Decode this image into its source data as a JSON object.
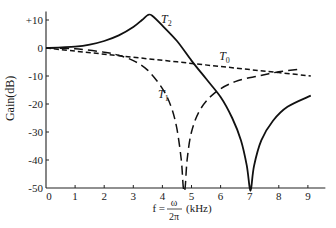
{
  "chart_data": {
    "type": "line",
    "title": "",
    "xlabel": "f = ω/2π (kHz)",
    "xlabel_parts": {
      "prefix": "f =",
      "num": "ω",
      "den": "2π",
      "suffix": "(kHz)"
    },
    "ylabel": "Gain(dB)",
    "xlim": [
      0,
      9.6
    ],
    "ylim": [
      -50,
      13
    ],
    "grid": false,
    "legend": "inline labels",
    "x_ticks": [
      0,
      1,
      2,
      3,
      4,
      5,
      6,
      7,
      8,
      9
    ],
    "x_tick_labels": [
      "0",
      "1",
      "2",
      "3",
      "4",
      "5",
      "6",
      "7",
      "8",
      "9"
    ],
    "y_ticks": [
      10,
      0,
      -10,
      -20,
      -30,
      -40,
      -50
    ],
    "y_tick_labels": [
      "+10",
      "0",
      "-10",
      "-20",
      "-30",
      "-40",
      "-50"
    ],
    "series": [
      {
        "name": "T0",
        "label": "T",
        "subscript": "0",
        "style": "short-dash",
        "points": [
          [
            0,
            0
          ],
          [
            1,
            -1.1
          ],
          [
            2,
            -2.2
          ],
          [
            3,
            -3.3
          ],
          [
            4,
            -4.4
          ],
          [
            5,
            -5.5
          ],
          [
            6,
            -6.6
          ],
          [
            7,
            -7.7
          ],
          [
            8,
            -8.8
          ],
          [
            9.1,
            -10
          ]
        ]
      },
      {
        "name": "T1",
        "label": "T",
        "subscript": "1",
        "style": "long-dash",
        "points": [
          [
            0,
            0
          ],
          [
            1,
            -0.3
          ],
          [
            2,
            -1.5
          ],
          [
            2.5,
            -2.6
          ],
          [
            3,
            -4.5
          ],
          [
            3.5,
            -8
          ],
          [
            4,
            -14.5
          ],
          [
            4.3,
            -21
          ],
          [
            4.5,
            -29
          ],
          [
            4.65,
            -40
          ],
          [
            4.72,
            -50
          ],
          [
            4.78,
            -50
          ],
          [
            4.85,
            -40
          ],
          [
            5,
            -30
          ],
          [
            5.3,
            -22
          ],
          [
            5.8,
            -16
          ],
          [
            6.5,
            -12
          ],
          [
            7.3,
            -10
          ],
          [
            8,
            -8.5
          ],
          [
            8.8,
            -7.5
          ]
        ]
      },
      {
        "name": "T2",
        "label": "T",
        "subscript": "2",
        "style": "solid",
        "points": [
          [
            0,
            0
          ],
          [
            1,
            0.5
          ],
          [
            1.5,
            1.2
          ],
          [
            2,
            2.5
          ],
          [
            2.5,
            4.5
          ],
          [
            3,
            7.5
          ],
          [
            3.3,
            10
          ],
          [
            3.5,
            11.8
          ],
          [
            3.65,
            11.5
          ],
          [
            4,
            8
          ],
          [
            4.5,
            2.5
          ],
          [
            5,
            -4.5
          ],
          [
            5.5,
            -11
          ],
          [
            6,
            -17.5
          ],
          [
            6.4,
            -25
          ],
          [
            6.7,
            -33
          ],
          [
            6.9,
            -42
          ],
          [
            7,
            -50
          ],
          [
            7.05,
            -50
          ],
          [
            7.15,
            -42
          ],
          [
            7.4,
            -33
          ],
          [
            7.8,
            -26
          ],
          [
            8.3,
            -21
          ],
          [
            9.1,
            -17
          ]
        ]
      }
    ],
    "annotations": [
      {
        "text": "T2",
        "x": 3.95,
        "y": 9
      },
      {
        "text": "T0",
        "x": 5.95,
        "y": -4.3
      },
      {
        "text": "T1",
        "x": 3.85,
        "y": -17.8
      }
    ]
  }
}
